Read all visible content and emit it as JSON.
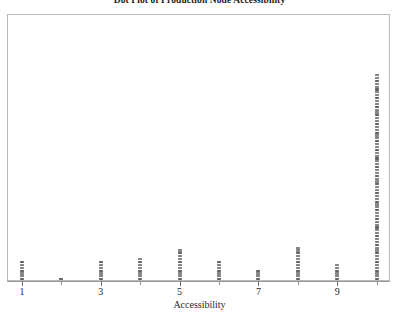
{
  "chart_data": {
    "type": "dotplot",
    "title": "Dot Plot of Production Node Accessibility",
    "xlabel": "Accessibility",
    "ylabel": "",
    "grid": false,
    "legend": null,
    "xlim": [
      0.4,
      10.6
    ],
    "tick_labels": [
      "1",
      "3",
      "5",
      "7",
      "9"
    ],
    "tick_values": [
      1,
      3,
      5,
      7,
      9
    ],
    "minor_tick_values": [
      2,
      4,
      6,
      8,
      10
    ],
    "categories": [
      1,
      2,
      3,
      4,
      5,
      6,
      7,
      8,
      9,
      10
    ],
    "values": [
      7,
      1,
      7,
      8,
      11,
      7,
      4,
      12,
      6,
      72
    ],
    "dot_color": "#8c8c8c",
    "frame_color": "#b9b9b9",
    "axis_color": "#9a9a9a"
  },
  "figure": {
    "title": "Dot Plot of Production Node Accessibility",
    "x_axis_title": "Accessibility"
  },
  "axis": {
    "ticks": [
      {
        "label": "1",
        "value": 1
      },
      {
        "label": "3",
        "value": 3
      },
      {
        "label": "5",
        "value": 5
      },
      {
        "label": "7",
        "value": 7
      },
      {
        "label": "9",
        "value": 9
      }
    ]
  }
}
